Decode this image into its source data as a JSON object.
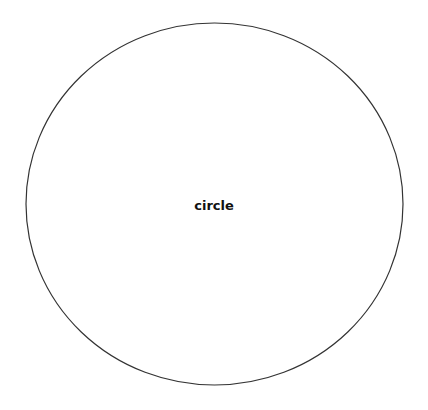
{
  "diagram": {
    "shapes": [
      {
        "type": "ellipse",
        "label": "circle",
        "cx": 214.5,
        "cy": 204,
        "rx": 188.5,
        "ry": 181,
        "stroke": "#333333",
        "fill": "#ffffff"
      }
    ]
  }
}
